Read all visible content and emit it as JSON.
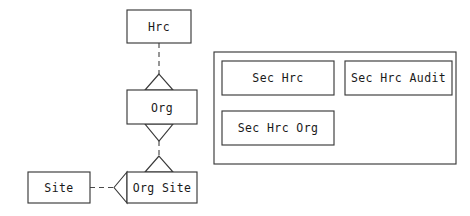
{
  "diagram": {
    "type": "entity-relationship-diagram",
    "background_color": "#ffffff",
    "line_color": "#3a3a3a",
    "text_color": "#1a1a1a",
    "entities": [
      {
        "id": "hrc",
        "label": "Hrc",
        "x": 127,
        "y": 10,
        "w": 64,
        "h": 33
      },
      {
        "id": "org",
        "label": "Org",
        "x": 127,
        "y": 90,
        "w": 70,
        "h": 34
      },
      {
        "id": "org_site",
        "label": "Org Site",
        "x": 127,
        "y": 172,
        "w": 70,
        "h": 31
      },
      {
        "id": "site",
        "label": "Site",
        "x": 28,
        "y": 172,
        "w": 62,
        "h": 31
      }
    ],
    "panel": {
      "id": "sec_panel",
      "x": 214,
      "y": 52,
      "w": 242,
      "h": 112,
      "entities": [
        {
          "id": "sec_hrc",
          "label": "Sec Hrc",
          "x": 222,
          "y": 61,
          "w": 112,
          "h": 34
        },
        {
          "id": "sec_hrc_audit",
          "label": "Sec Hrc Audit",
          "x": 345,
          "y": 61,
          "w": 107,
          "h": 34
        },
        {
          "id": "sec_hrc_org",
          "label": "Sec Hrc Org",
          "x": 222,
          "y": 111,
          "w": 112,
          "h": 34
        }
      ]
    },
    "connectors": [
      {
        "id": "hrc-to-org",
        "from": "hrc",
        "to": "org",
        "style": "dashed",
        "arrow": "open-triangle-up"
      },
      {
        "id": "org-to-org-site",
        "from": "org",
        "to": "org_site",
        "style": "dashed",
        "arrow": "open-triangle-down-up"
      },
      {
        "id": "site-to-org-site",
        "from": "site",
        "to": "org_site",
        "style": "dashed",
        "arrow": "open-triangle-left"
      }
    ]
  },
  "labels": {
    "hrc": "Hrc",
    "org": "Org",
    "org_site": "Org Site",
    "site": "Site",
    "sec_hrc": "Sec Hrc",
    "sec_hrc_audit": "Sec Hrc Audit",
    "sec_hrc_org": "Sec Hrc Org"
  }
}
